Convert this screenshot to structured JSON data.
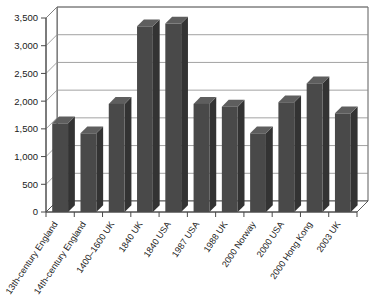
{
  "chart_data": {
    "type": "bar",
    "title": "",
    "subtitle": "",
    "xlabel": "",
    "ylabel": "",
    "ylim": [
      0,
      3500
    ],
    "ytick_step": 500,
    "grid": true,
    "legend": "none",
    "three_d": true,
    "categories": [
      "13th-century England",
      "14th-century England",
      "1400–1600 UK",
      "1840 UK",
      "1840 USA",
      "1987 USA",
      "1988 UK",
      "2000 Norway",
      "2000 USA",
      "2000 Hong Kong",
      "2003 UK"
    ],
    "values": [
      1600,
      1420,
      1950,
      3350,
      3400,
      1950,
      1900,
      1420,
      1980,
      2320,
      1780
    ],
    "ytick_labels": [
      "0",
      "500",
      "1,000",
      "1,500",
      "2,000",
      "2,500",
      "3,000",
      "3,500"
    ],
    "ytick_values": [
      0,
      500,
      1000,
      1500,
      2000,
      2500,
      3000,
      3500
    ],
    "series": [
      {
        "name": "",
        "values": [
          1600,
          1420,
          1950,
          3350,
          3400,
          1950,
          1900,
          1420,
          1980,
          2320,
          1780
        ]
      }
    ],
    "colors": {
      "bar_front": "#494949",
      "bar_top": "#5e5e5e",
      "bar_side": "#333333",
      "gridline": "#8a8a8a",
      "axis": "#4a4a4a",
      "background": "#ffffff",
      "text": "#1a1a1a"
    }
  }
}
